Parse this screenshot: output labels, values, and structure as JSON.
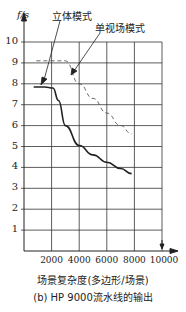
{
  "chart_data": {
    "type": "line",
    "title": "",
    "ylabel": "f/s",
    "xlabel": "场景复杂度(多边形/场景)",
    "caption": "(b) HP 9000流水线的输出",
    "xlim": [
      0,
      10000
    ],
    "ylim": [
      0,
      10
    ],
    "grid": true,
    "x_ticks": [
      "2000",
      "4000",
      "6000",
      "8000",
      "10000"
    ],
    "y_ticks": [
      "1",
      "2",
      "3",
      "4",
      "5",
      "6",
      "7",
      "8",
      "9",
      "10"
    ],
    "series": [
      {
        "name": "立体模式",
        "style": "solid",
        "x": [
          700,
          1500,
          2100,
          2500,
          3000,
          4000,
          5000,
          6000,
          7000,
          7800
        ],
        "y": [
          7.85,
          7.85,
          7.8,
          7.2,
          6.0,
          5.05,
          4.6,
          4.25,
          3.95,
          3.7
        ]
      },
      {
        "name": "单视场模式",
        "style": "dashed",
        "x": [
          900,
          2000,
          3000,
          4000,
          5000,
          6000,
          7000,
          7800
        ],
        "y": [
          9.1,
          9.1,
          9.1,
          8.0,
          7.3,
          6.6,
          6.0,
          5.6
        ]
      }
    ],
    "annotations": [
      {
        "text": "立体模式",
        "points_to_series": "立体模式"
      },
      {
        "text": "单视场模式",
        "points_to_series": "单视场模式"
      }
    ]
  }
}
